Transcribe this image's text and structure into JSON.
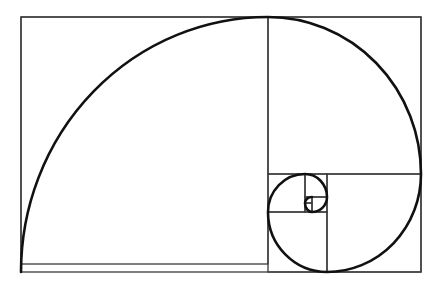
{
  "diagram": {
    "colors": {
      "background": "#ffffff",
      "square_lines": "#3a3a3a",
      "spiral": "#111111"
    },
    "outer_rectangle": {
      "x": 21,
      "y": 17,
      "w": 400,
      "h": 255
    },
    "squares": [
      {
        "x": 21,
        "y": 17,
        "size": 247
      },
      {
        "x": 268,
        "y": 17,
        "size": 153,
        "h": 157
      },
      {
        "x": 327,
        "y": 174,
        "size": 94,
        "h": 98
      },
      {
        "x": 268,
        "y": 212,
        "size": 59,
        "h": 60
      },
      {
        "x": 268,
        "y": 174,
        "size": 37,
        "h": 38
      },
      {
        "x": 305,
        "y": 174,
        "size": 22,
        "h": 23
      },
      {
        "x": 312,
        "y": 197,
        "size": 15,
        "h": 15
      },
      {
        "x": 305,
        "y": 203,
        "size": 7,
        "h": 9
      },
      {
        "x": 305,
        "y": 197,
        "size": 7,
        "h": 6
      }
    ]
  }
}
